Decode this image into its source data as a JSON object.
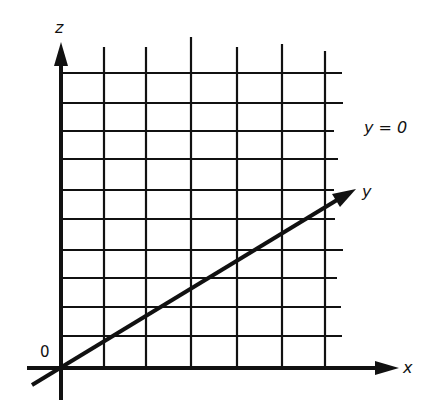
{
  "diagram": {
    "plane_label": "y = 0",
    "axes": {
      "x": "x",
      "y": "y",
      "z": "z",
      "origin": "0"
    },
    "colors": {
      "ink": "#111111",
      "background": "#ffffff"
    },
    "grid": {
      "vertical_lines_x": [
        104,
        146,
        191,
        237,
        282,
        325
      ],
      "vertical_tops": [
        47,
        47,
        37,
        47,
        44,
        51
      ],
      "horizontal_lines_y": [
        73,
        103,
        131,
        159,
        190,
        219,
        250,
        278,
        307,
        336
      ],
      "horizontal_right": [
        342,
        343,
        334,
        338,
        334,
        335,
        343,
        337,
        341,
        342
      ]
    }
  }
}
